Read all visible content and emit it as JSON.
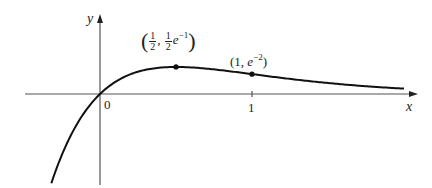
{
  "chart_data": {
    "type": "line",
    "function": "y = x e^(-2x)",
    "title": "",
    "xlabel": "x",
    "ylabel": "y",
    "xlim": [
      -0.5,
      2.1
    ],
    "ylim": [
      -0.62,
      0.63
    ],
    "grid": false,
    "legend": null,
    "x_ticks": [
      {
        "value": 0,
        "label": "0"
      },
      {
        "value": 1,
        "label": "1"
      }
    ],
    "series": [
      {
        "name": "y = x e^{-2x}",
        "x_range": [
          -0.32,
          2.0
        ],
        "sample_points": [
          {
            "x": -0.32,
            "y": -0.607
          },
          {
            "x": -0.2,
            "y": -0.298
          },
          {
            "x": 0,
            "y": 0
          },
          {
            "x": 0.25,
            "y": 0.152
          },
          {
            "x": 0.5,
            "y": 0.184
          },
          {
            "x": 1,
            "y": 0.135
          },
          {
            "x": 1.5,
            "y": 0.075
          },
          {
            "x": 2.0,
            "y": 0.037
          }
        ]
      }
    ],
    "annotations": [
      {
        "x": 0.5,
        "y": 0.184,
        "label": "(1/2, 1/2 e^-1)",
        "marker": "dot"
      },
      {
        "x": 1,
        "y": 0.135,
        "label": "(1, e^-2)",
        "marker": "dot"
      }
    ]
  },
  "labels": {
    "y_axis": "y",
    "x_axis": "x",
    "origin": "0",
    "tick_one": "1",
    "max_point": {
      "open": "(",
      "frac1_num": "1",
      "frac1_den": "2",
      "comma": ",",
      "frac2_num": "1",
      "frac2_den": "2",
      "base": "e",
      "exp": "−1",
      "close": ")"
    },
    "point_one": {
      "open": "(1, ",
      "base": "e",
      "exp": "−2",
      "close": ")"
    }
  },
  "layout": {
    "origin_px": [
      100,
      94
    ],
    "x_scale": 152,
    "y_scale": 147,
    "x_axis_px": [
      25,
      418
    ],
    "y_axis_px": [
      185,
      14
    ],
    "curve_color": "#111111",
    "axis_color": "#555555"
  }
}
